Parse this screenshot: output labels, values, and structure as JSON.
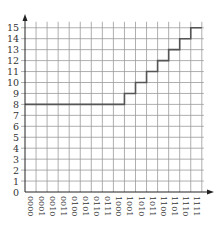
{
  "chart_data": {
    "type": "line",
    "subtype": "step",
    "title": "",
    "xlabel": "",
    "ylabel": "",
    "categories": [
      "0000",
      "0001",
      "0010",
      "0011",
      "0100",
      "0101",
      "0110",
      "0111",
      "1000",
      "1001",
      "1010",
      "1011",
      "1100",
      "1101",
      "1110",
      "1111"
    ],
    "series": [
      {
        "name": "output",
        "values": [
          8,
          8,
          8,
          8,
          8,
          8,
          8,
          8,
          8,
          9,
          10,
          11,
          12,
          13,
          14,
          15
        ]
      }
    ],
    "y_ticks": [
      0,
      1,
      2,
      3,
      4,
      5,
      6,
      7,
      8,
      9,
      10,
      11,
      12,
      13,
      14,
      15
    ],
    "ylim": [
      0,
      15
    ],
    "grid": true,
    "legend": null,
    "colors": {
      "line": "#555555",
      "grid": "#9a9a9a",
      "axis": "#222222"
    }
  }
}
